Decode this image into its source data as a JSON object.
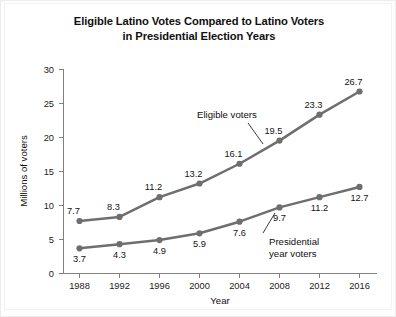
{
  "chart_data": {
    "type": "line",
    "title": "Eligible Latino Votes Compared to Latino Voters in Presidential Election Years",
    "title_lines": [
      "Eligible Latino Votes Compared to Latino Voters",
      "in Presidential Election Years"
    ],
    "xlabel": "Year",
    "ylabel": "Millions of voters",
    "categories": [
      "1988",
      "1992",
      "1996",
      "2000",
      "2004",
      "2008",
      "2012",
      "2016"
    ],
    "x": [
      1988,
      1992,
      1996,
      2000,
      2004,
      2008,
      2012,
      2016
    ],
    "xlim": [
      1986,
      2018
    ],
    "ylim": [
      0,
      30
    ],
    "ytick_labels": [
      "30",
      "25",
      "20",
      "15",
      "10",
      "5",
      "0"
    ],
    "yticks": [
      30,
      25,
      20,
      15,
      10,
      5,
      0
    ],
    "grid": false,
    "legend": "annotations-inline",
    "series": [
      {
        "name": "Eligible voters",
        "values": [
          7.7,
          8.3,
          11.2,
          13.2,
          16.1,
          19.5,
          23.3,
          26.7
        ],
        "labels": [
          "7.7",
          "8.3",
          "11.2",
          "13.2",
          "16.1",
          "19.5",
          "23.3",
          "26.7"
        ],
        "color": "#6e6e6e",
        "label_position": "above-left"
      },
      {
        "name": "Presidential year voters",
        "values": [
          3.7,
          4.3,
          4.9,
          5.9,
          7.6,
          9.7,
          11.2,
          12.7
        ],
        "labels": [
          "3.7",
          "4.3",
          "4.9",
          "5.9",
          "7.6",
          "9.7",
          "11.2",
          "12.7"
        ],
        "color": "#6e6e6e",
        "label_position": "below"
      }
    ],
    "annotations": [
      {
        "text": "Eligible voters",
        "lines": [
          "Eligible voters"
        ],
        "points_to_series": "Eligible voters"
      },
      {
        "text": "Presidential year voters",
        "lines": [
          "Presidential",
          "year voters"
        ],
        "points_to_series": "Presidential year voters"
      }
    ]
  }
}
